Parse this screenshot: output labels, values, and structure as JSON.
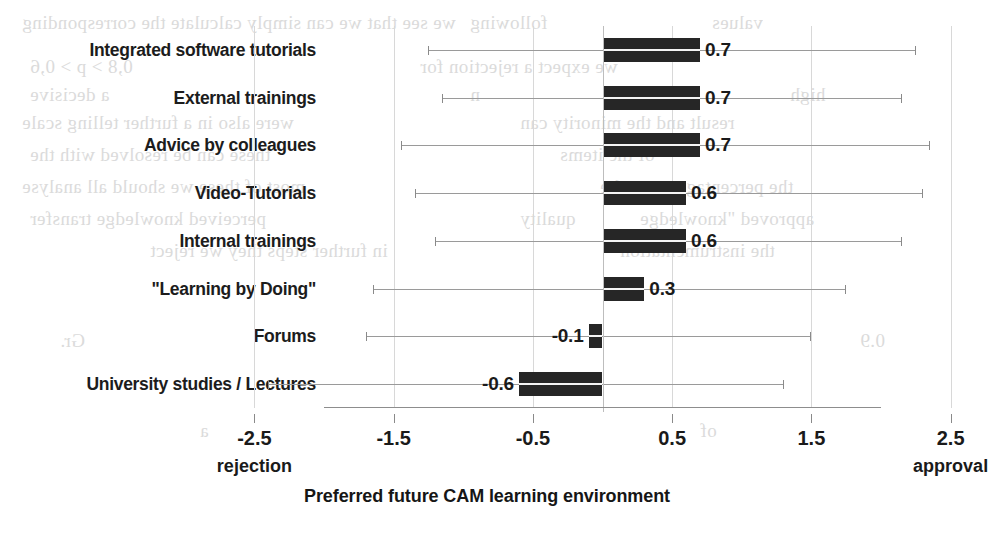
{
  "chart_data": {
    "type": "bar",
    "orientation": "horizontal",
    "title": "",
    "xlabel": "Preferred future CAM learning environment",
    "ylabel": "",
    "xlim": [
      -2.5,
      2.5
    ],
    "grid": true,
    "legend": "none",
    "axis_end_labels": {
      "left": "rejection",
      "right": "approval"
    },
    "xticks": [
      -2.5,
      -1.5,
      -0.5,
      0.5,
      1.5,
      2.5
    ],
    "xticklabels": [
      "-2.5",
      "-1.5",
      "-0.5",
      "0.5",
      "1.5",
      "2.5"
    ],
    "categories": [
      "Integrated software tutorials",
      "External trainings",
      "Advice by colleagues",
      "Video-Tutorials",
      "Internal trainings",
      "\"Learning by Doing\"",
      "Forums",
      "University studies / Lectures"
    ],
    "values": [
      0.7,
      0.7,
      0.7,
      0.6,
      0.6,
      0.3,
      -0.1,
      -0.6
    ],
    "value_labels": [
      "0.7",
      "0.7",
      "0.7",
      "0.6",
      "0.6",
      "0.3",
      "-0.1",
      "-0.6"
    ],
    "error_low": [
      -1.25,
      -1.15,
      -1.45,
      -1.35,
      -1.2,
      -1.65,
      -1.7,
      -2.4
    ],
    "error_high": [
      2.25,
      2.15,
      2.35,
      2.3,
      2.15,
      1.75,
      1.5,
      1.3
    ]
  },
  "ghost_text": [
    {
      "text": "we see that we can simply calculate the corresponding",
      "x": 22,
      "y": 12
    },
    {
      "text": "following",
      "x": 470,
      "y": 12
    },
    {
      "text": "values",
      "x": 712,
      "y": 12
    },
    {
      "text": "0,8 > p > 0,6",
      "x": 30,
      "y": 56
    },
    {
      "text": "we expect a rejection for",
      "x": 420,
      "y": 56
    },
    {
      "text": "a decisive",
      "x": 30,
      "y": 84
    },
    {
      "text": "n",
      "x": 470,
      "y": 84
    },
    {
      "text": "high",
      "x": 790,
      "y": 84
    },
    {
      "text": "were also in a further telling scale",
      "x": 22,
      "y": 112
    },
    {
      "text": "result and the minority can",
      "x": 520,
      "y": 112
    },
    {
      "text": "these can be resolved with the",
      "x": 30,
      "y": 144
    },
    {
      "text": "of the items",
      "x": 560,
      "y": 144
    },
    {
      "text": "most of these we should all analyse",
      "x": 22,
      "y": 176
    },
    {
      "text": "the percentage we at the",
      "x": 600,
      "y": 176
    },
    {
      "text": "perceived knowledge transfer",
      "x": 30,
      "y": 208
    },
    {
      "text": "quality",
      "x": 520,
      "y": 208
    },
    {
      "text": "approved \"knowledge",
      "x": 640,
      "y": 208
    },
    {
      "text": "in further steps they we reject",
      "x": 150,
      "y": 240
    },
    {
      "text": "the instrumentation",
      "x": 620,
      "y": 240
    },
    {
      "text": "Gr.",
      "x": 60,
      "y": 330
    },
    {
      "text": "0.9",
      "x": 860,
      "y": 330
    },
    {
      "text": "a",
      "x": 200,
      "y": 420
    },
    {
      "text": "of",
      "x": 700,
      "y": 420
    }
  ]
}
